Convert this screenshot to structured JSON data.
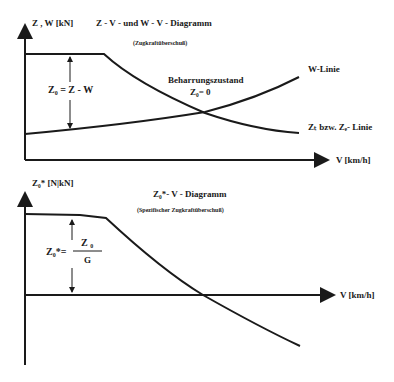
{
  "top_diagram": {
    "y_axis_label": "Z , W [kN]",
    "title": "Z - V - und W - V - Diagramm",
    "subtitle": "(Zugkraftüberschuß)",
    "x_axis_label": "V [km/h]",
    "equation": "Z₀ = Z - W",
    "steady_state_label": "Beharrungszustand",
    "steady_state_equation": "Z₀= 0",
    "w_line_label": "W-Linie",
    "z_line_label": "Zₜ bzw. Zₑ- Linie"
  },
  "bottom_diagram": {
    "y_axis_label": "Z₀* [N|kN]",
    "title": "Z₀*- V - Diagramm",
    "subtitle": "(Spezifischer Zugkraftüberschuß)",
    "x_axis_label": "V [km/h]",
    "equation_lhs": "Z₀*=",
    "fraction_numerator": "Z ₀",
    "fraction_denominator": "G"
  },
  "colors": {
    "line": "#1a1a1a",
    "background": "#ffffff"
  }
}
